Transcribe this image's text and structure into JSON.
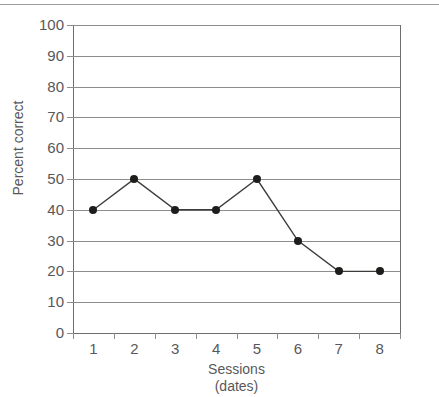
{
  "figure": {
    "top_rule_color": "#9a9a9c",
    "background_color": "#ffffff",
    "axis_color": "#6e6e71",
    "grid_color": "#8d8d90",
    "text_color": "#58585a",
    "marker_color": "#1d1d1b",
    "line_color": "#3c3c3b"
  },
  "chart_data": {
    "type": "line",
    "title": "",
    "subtitle": "",
    "xlabel": "Sessions",
    "xlabel_line2": "(dates)",
    "ylabel": "Percent correct",
    "x": [
      1,
      2,
      3,
      4,
      5,
      6,
      7,
      8
    ],
    "categories": [
      "1",
      "2",
      "3",
      "4",
      "5",
      "6",
      "7",
      "8"
    ],
    "values": [
      40,
      50,
      40,
      40,
      50,
      30,
      20,
      20
    ],
    "series": [
      {
        "name": "Percent correct",
        "values": [
          40,
          50,
          40,
          40,
          50,
          30,
          20,
          20
        ]
      }
    ],
    "xlim": [
      0.5,
      8.5
    ],
    "ylim": [
      0,
      100
    ],
    "yticks": [
      0,
      10,
      20,
      30,
      40,
      50,
      60,
      70,
      80,
      90,
      100
    ],
    "ytick_labels": [
      "0",
      "10",
      "20",
      "30",
      "40",
      "50",
      "60",
      "70",
      "80",
      "90",
      "100"
    ],
    "xticks": [
      1,
      2,
      3,
      4,
      5,
      6,
      7,
      8
    ],
    "xtick_labels": [
      "1",
      "2",
      "3",
      "4",
      "5",
      "6",
      "7",
      "8"
    ],
    "grid": "horizontal",
    "legend": "none",
    "markers": "filled-circle",
    "annotations": []
  }
}
